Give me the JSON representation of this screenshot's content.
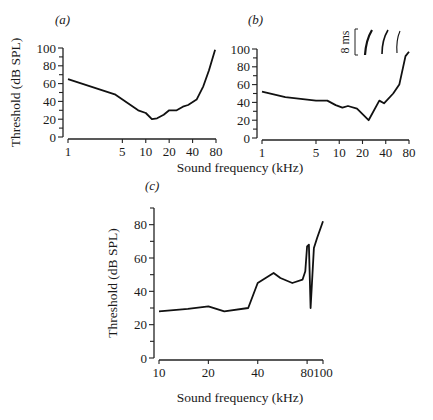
{
  "chart_data": [
    {
      "type": "line",
      "panel_label": "(a)",
      "xlabel": "Sound frequency (kHz)",
      "ylabel": "Threshold (dB SPL)",
      "xscale": "log",
      "xticks": [
        1,
        5,
        10,
        20,
        40,
        80
      ],
      "yticks": [
        0,
        20,
        40,
        60,
        80,
        100
      ],
      "xlim": [
        1,
        80
      ],
      "ylim": [
        0,
        100
      ],
      "grid": false,
      "series": [
        {
          "name": "threshold",
          "x": [
            1,
            4,
            8,
            10,
            12,
            14,
            17,
            20,
            25,
            30,
            35,
            45,
            55,
            65,
            78
          ],
          "y": [
            65,
            48,
            30,
            27,
            20,
            21,
            25,
            30,
            30,
            34,
            36,
            42,
            57,
            75,
            98
          ]
        }
      ]
    },
    {
      "type": "line",
      "panel_label": "(b)",
      "xlabel": "Sound frequency (kHz)",
      "ylabel": "",
      "xscale": "log",
      "xticks": [
        1,
        5,
        10,
        20,
        40,
        80
      ],
      "yticks": [
        0,
        20,
        40,
        60,
        80,
        100
      ],
      "xlim": [
        1,
        80
      ],
      "ylim": [
        0,
        100
      ],
      "grid": false,
      "inset_label": "8 ms",
      "series": [
        {
          "name": "threshold",
          "x": [
            1,
            2,
            5,
            7,
            9,
            11,
            13,
            17,
            24,
            33,
            38,
            50,
            60,
            72,
            80
          ],
          "y": [
            52,
            46,
            42,
            42,
            37,
            34,
            36,
            33,
            20,
            42,
            39,
            50,
            60,
            92,
            97
          ]
        }
      ]
    },
    {
      "type": "line",
      "panel_label": "(c)",
      "xlabel": "Sound frequency (kHz)",
      "ylabel": "Threshold (dB SPL)",
      "xscale": "log",
      "xticks": [
        10,
        20,
        40,
        80,
        100
      ],
      "yticks": [
        0,
        20,
        40,
        60,
        80
      ],
      "xlim": [
        10,
        100
      ],
      "ylim": [
        0,
        90
      ],
      "grid": false,
      "series": [
        {
          "name": "threshold",
          "x": [
            10,
            15,
            20,
            25,
            35,
            40,
            50,
            55,
            65,
            75,
            78,
            80,
            82,
            84,
            88,
            92,
            100
          ],
          "y": [
            28,
            29.5,
            31,
            28,
            30,
            45,
            51,
            48,
            45,
            47,
            52,
            67,
            68,
            30,
            66,
            72,
            82
          ]
        }
      ]
    }
  ]
}
